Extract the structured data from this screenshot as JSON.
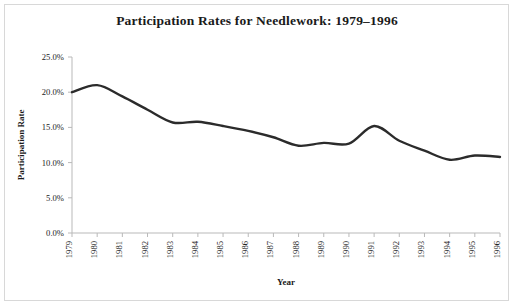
{
  "chart_data": {
    "type": "line",
    "title": "Participation Rates for Needlework: 1979–1996",
    "xlabel": "Year",
    "ylabel": "Participation Rate",
    "categories": [
      "1979",
      "1980",
      "1981",
      "1982",
      "1983",
      "1984",
      "1985",
      "1986",
      "1987",
      "1988",
      "1989",
      "1990",
      "1991",
      "1992",
      "1993",
      "1994",
      "1995",
      "1996"
    ],
    "x": [
      1979,
      1980,
      1981,
      1982,
      1983,
      1984,
      1985,
      1986,
      1987,
      1988,
      1989,
      1990,
      1991,
      1992,
      1993,
      1994,
      1995,
      1996
    ],
    "values": [
      20.0,
      21.0,
      19.4,
      17.5,
      15.7,
      15.8,
      15.2,
      14.5,
      13.6,
      12.4,
      12.8,
      12.7,
      15.2,
      13.1,
      11.7,
      10.4,
      11.0,
      10.8
    ],
    "series": [
      {
        "name": "Participation Rate",
        "values": [
          20.0,
          21.0,
          19.4,
          17.5,
          15.7,
          15.8,
          15.2,
          14.5,
          13.6,
          12.4,
          12.8,
          12.7,
          15.2,
          13.1,
          11.7,
          10.4,
          11.0,
          10.8
        ]
      }
    ],
    "ylim": [
      0.0,
      25.0
    ],
    "ytick_values": [
      0.0,
      5.0,
      10.0,
      15.0,
      20.0,
      25.0
    ],
    "ytick_labels": [
      "0.0%",
      "5.0%",
      "10.0%",
      "15.0%",
      "20.0%",
      "25.0%"
    ],
    "xtick_labels": [
      "1979",
      "1980",
      "1981",
      "1982",
      "1983",
      "1984",
      "1985",
      "1986",
      "1987",
      "1988",
      "1989",
      "1990",
      "1991",
      "1992",
      "1993",
      "1994",
      "1995",
      "1996"
    ],
    "grid": false,
    "legend": "none",
    "line_color": "#2b2b2b",
    "axis_color": "#b5b5b5",
    "background_color": "#ffffff",
    "xtick_rotation": 90,
    "smoothing": "spline"
  }
}
